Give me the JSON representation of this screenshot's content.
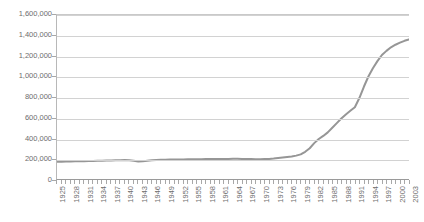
{
  "title_fragment": "",
  "colors": {
    "series_line": "#969696",
    "gridline": "#d2d2d2",
    "axis": "#9a9a9a",
    "tick_label": "#6d6d6d",
    "plot_background": "#ffffff"
  },
  "chart_data": {
    "type": "line",
    "title": "",
    "xlabel": "",
    "ylabel": "",
    "ylim": [
      0,
      1600000
    ],
    "y_ticks": [
      0,
      200000,
      400000,
      600000,
      800000,
      1000000,
      1200000,
      1400000,
      1600000
    ],
    "y_tick_labels": [
      "0",
      "200,000",
      "400,000",
      "600,000",
      "800,000",
      "1,000,000",
      "1,200,000",
      "1,400,000",
      "1,600,000"
    ],
    "grid": "horizontal",
    "legend": "none",
    "x_tick_labels": [
      "1925",
      "1928",
      "1931",
      "1934",
      "1937",
      "1940",
      "1943",
      "1946",
      "1949",
      "1952",
      "1955",
      "1958",
      "1961",
      "1964",
      "1967",
      "1970",
      "1973",
      "1976",
      "1979",
      "1982",
      "1985",
      "1988",
      "1991",
      "1994",
      "1997",
      "2000",
      "2003"
    ],
    "x_tick_interval": 3,
    "x": [
      1925,
      1926,
      1927,
      1928,
      1929,
      1930,
      1931,
      1932,
      1933,
      1934,
      1935,
      1936,
      1937,
      1938,
      1939,
      1940,
      1941,
      1942,
      1943,
      1944,
      1945,
      1946,
      1947,
      1948,
      1949,
      1950,
      1951,
      1952,
      1953,
      1954,
      1955,
      1956,
      1957,
      1958,
      1959,
      1960,
      1961,
      1962,
      1963,
      1964,
      1965,
      1966,
      1967,
      1968,
      1969,
      1970,
      1971,
      1972,
      1973,
      1974,
      1975,
      1976,
      1977,
      1978,
      1979,
      1980,
      1981,
      1982,
      1983,
      1984,
      1985,
      1986,
      1987,
      1988,
      1989,
      1990,
      1991,
      1992,
      1993,
      1994,
      1995,
      1996,
      1997,
      1998,
      1999,
      2000,
      2001,
      2002,
      2003
    ],
    "values": [
      168000,
      169000,
      170000,
      171000,
      172000,
      173000,
      174000,
      175000,
      176000,
      177000,
      178000,
      180000,
      181000,
      183000,
      184000,
      185000,
      183000,
      178000,
      170000,
      172000,
      178000,
      183000,
      186000,
      188000,
      189000,
      190000,
      190000,
      191000,
      191000,
      192000,
      192000,
      193000,
      193000,
      194000,
      194000,
      195000,
      195000,
      196000,
      196000,
      197000,
      197000,
      196000,
      195000,
      194000,
      193000,
      193000,
      194000,
      196000,
      200000,
      205000,
      210000,
      215000,
      220000,
      228000,
      240000,
      265000,
      300000,
      350000,
      390000,
      420000,
      455000,
      500000,
      545000,
      590000,
      630000,
      665000,
      700000,
      790000,
      900000,
      1000000,
      1080000,
      1150000,
      1210000,
      1250000,
      1285000,
      1310000,
      1330000,
      1348000,
      1362000
    ],
    "series": [
      {
        "name": "",
        "values": [
          168000,
          169000,
          170000,
          171000,
          172000,
          173000,
          174000,
          175000,
          176000,
          177000,
          178000,
          180000,
          181000,
          183000,
          184000,
          185000,
          183000,
          178000,
          170000,
          172000,
          178000,
          183000,
          186000,
          188000,
          189000,
          190000,
          190000,
          191000,
          191000,
          192000,
          192000,
          193000,
          193000,
          194000,
          194000,
          195000,
          195000,
          196000,
          196000,
          197000,
          197000,
          196000,
          195000,
          194000,
          193000,
          193000,
          194000,
          196000,
          200000,
          205000,
          210000,
          215000,
          220000,
          228000,
          240000,
          265000,
          300000,
          350000,
          390000,
          420000,
          455000,
          500000,
          545000,
          590000,
          630000,
          665000,
          700000,
          790000,
          900000,
          1000000,
          1080000,
          1150000,
          1210000,
          1250000,
          1285000,
          1310000,
          1330000,
          1348000,
          1362000
        ]
      }
    ]
  }
}
